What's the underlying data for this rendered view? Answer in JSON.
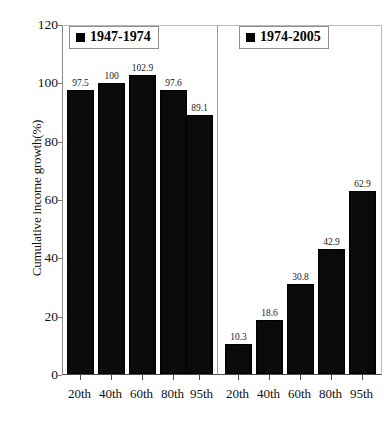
{
  "chart_data": {
    "type": "bar",
    "title": "",
    "xlabel": "",
    "ylabel": "Cumulative income growth(%)",
    "ylim": [
      0,
      120
    ],
    "yticks": [
      0,
      20,
      40,
      60,
      80,
      100,
      120
    ],
    "grid": false,
    "legend_position": "inside-top",
    "categories": [
      "20th",
      "40th",
      "60th",
      "80th",
      "95th"
    ],
    "series": [
      {
        "name": "1947-1974",
        "values": [
          97.5,
          100,
          102.9,
          97.6,
          89.1
        ],
        "value_labels": [
          "97.5",
          "100",
          "102.9",
          "97.6",
          "89.1"
        ],
        "color": "#000000"
      },
      {
        "name": "1974-2005",
        "values": [
          10.3,
          18.6,
          30.8,
          42.9,
          62.9
        ],
        "value_labels": [
          "10.3",
          "18.6",
          "30.8",
          "42.9",
          "62.9"
        ],
        "color": "#000000"
      }
    ],
    "panel_x_labels": [
      "20th",
      "40th",
      "60th",
      "80th",
      "95th",
      "20th",
      "40th",
      "60th",
      "80th",
      "95th"
    ],
    "ytick_labels": [
      "0",
      "20",
      "40",
      "60",
      "80",
      "100",
      "120"
    ]
  },
  "axes": {
    "y_title": "Cumulative income growth(%)",
    "y_tick_labels": [
      "120",
      "100",
      "80",
      "60",
      "40",
      "20",
      "0"
    ],
    "x_tick_labels": [
      "20th",
      "40th",
      "60th",
      "80th",
      "95th",
      "20th",
      "40th",
      "60th",
      "80th",
      "95th"
    ]
  },
  "legend": {
    "left": {
      "label": "1947-1974",
      "marker": "black-square"
    },
    "right": {
      "label": "1974-2005",
      "marker": "black-square"
    }
  },
  "bars": {
    "left_panel": [
      {
        "category": "20th",
        "value": 97.5,
        "label": "97.5"
      },
      {
        "category": "40th",
        "value": 100,
        "label": "100"
      },
      {
        "category": "60th",
        "value": 102.9,
        "label": "102.9"
      },
      {
        "category": "80th",
        "value": 97.6,
        "label": "97.6"
      },
      {
        "category": "95th",
        "value": 89.1,
        "label": "89.1"
      }
    ],
    "right_panel": [
      {
        "category": "20th",
        "value": 10.3,
        "label": "10.3"
      },
      {
        "category": "40th",
        "value": 18.6,
        "label": "18.6"
      },
      {
        "category": "60th",
        "value": 30.8,
        "label": "30.8"
      },
      {
        "category": "80th",
        "value": 42.9,
        "label": "42.9"
      },
      {
        "category": "95th",
        "value": 62.9,
        "label": "62.9"
      }
    ]
  },
  "colors": {
    "bar_fill": "#000000",
    "plot_border": "#8a8a8a",
    "divider": "#9a9a9a",
    "text": "#111111",
    "background": "#ffffff"
  }
}
